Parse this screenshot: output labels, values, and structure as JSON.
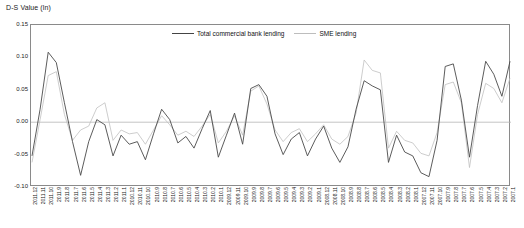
{
  "chart_data": {
    "type": "line",
    "title": "D-S Value (ln)",
    "xlabel": "",
    "ylabel": "D-S Value (ln)",
    "ylim": [
      -0.1,
      0.15
    ],
    "yticks": [
      0.15,
      0.1,
      0.05,
      0.0,
      -0.05,
      -0.1
    ],
    "ytick_labels": [
      "0.15",
      "0.10",
      "0.05",
      "0.00",
      "-0.05",
      "-0.10"
    ],
    "grid": false,
    "legend_position": "top-center",
    "categories": [
      "2011.12",
      "2011.11",
      "2011.10",
      "2011.9",
      "2011.8",
      "2011.7",
      "2011.6",
      "2011.5",
      "2011.4",
      "2011.3",
      "2011.2",
      "2011.1",
      "2010.12",
      "2010.11",
      "2010.10",
      "2010.9",
      "2010.8",
      "2010.7",
      "2010.6",
      "2010.5",
      "2010.4",
      "2010.3",
      "2010.2",
      "2010.1",
      "2009.12",
      "2009.11",
      "2009.10",
      "2009.9",
      "2009.8",
      "2009.7",
      "2009.6",
      "2009.5",
      "2009.4",
      "2009.3",
      "2009.2",
      "2009.1",
      "2008.12",
      "2008.11",
      "2008.10",
      "2008.9",
      "2008.8",
      "2008.7",
      "2008.6",
      "2008.5",
      "2008.4",
      "2008.3",
      "2008.2",
      "2008.1",
      "2007.12",
      "2007.11",
      "2007.10",
      "2007.9",
      "2007.8",
      "2007.7",
      "2007.6",
      "2007.5",
      "2007.4",
      "2007.3",
      "2007.2",
      "2007.1"
    ],
    "series": [
      {
        "name": "Total commercial bank lending",
        "color": "#4a4a4a",
        "values": [
          -0.052,
          0.02,
          0.108,
          0.092,
          0.03,
          -0.03,
          -0.082,
          -0.03,
          0.004,
          -0.004,
          -0.052,
          -0.02,
          -0.034,
          -0.03,
          -0.058,
          -0.018,
          0.02,
          0.004,
          -0.032,
          -0.022,
          -0.04,
          -0.01,
          0.018,
          -0.054,
          -0.02,
          0.014,
          -0.034,
          0.052,
          0.058,
          0.04,
          -0.018,
          -0.05,
          -0.026,
          -0.016,
          -0.052,
          -0.026,
          -0.006,
          -0.04,
          -0.062,
          -0.038,
          0.02,
          0.064,
          0.056,
          0.05,
          -0.062,
          -0.02,
          -0.046,
          -0.052,
          -0.078,
          -0.084,
          -0.028,
          0.086,
          0.09,
          0.034,
          -0.054,
          0.026,
          0.094,
          0.074,
          0.04,
          0.094
        ]
      },
      {
        "name": "SME lending",
        "color": "#c0c0c0",
        "values": [
          -0.062,
          0.004,
          0.072,
          0.078,
          0.012,
          -0.028,
          -0.012,
          -0.006,
          0.022,
          0.03,
          -0.028,
          -0.012,
          -0.018,
          -0.016,
          -0.034,
          -0.012,
          0.01,
          -0.004,
          -0.02,
          -0.014,
          -0.022,
          -0.006,
          0.012,
          -0.032,
          -0.014,
          0.01,
          -0.02,
          0.048,
          0.056,
          0.028,
          -0.012,
          -0.03,
          -0.016,
          -0.01,
          -0.03,
          -0.018,
          -0.004,
          -0.026,
          -0.034,
          -0.022,
          0.014,
          0.096,
          0.08,
          0.076,
          -0.04,
          -0.014,
          -0.028,
          -0.032,
          -0.048,
          -0.052,
          -0.016,
          0.058,
          0.062,
          0.03,
          -0.07,
          0.012,
          0.06,
          0.052,
          0.03,
          0.068
        ]
      }
    ]
  }
}
